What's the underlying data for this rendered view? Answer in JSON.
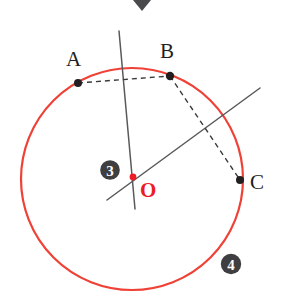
{
  "figure": {
    "width": 281,
    "height": 308,
    "background": "#ffffff"
  },
  "colors": {
    "circle_stroke": "#ef4136",
    "center_accent": "#ed1c24",
    "point_fill": "#231f20",
    "line_stroke": "#58595b",
    "dash_stroke": "#3a3a3a",
    "badge_fill": "#3f3f41",
    "badge_text": "#ffffff",
    "chevron_fill": "#4a4a4c"
  },
  "circle": {
    "name": "main-circle",
    "cx": 132,
    "cy": 179,
    "r": 111,
    "stroke_width": 2.2
  },
  "points": [
    {
      "id": "A",
      "label": "A",
      "x": 78,
      "y": 83,
      "label_x": 66,
      "label_y": 66,
      "dot_r": 4.0,
      "color": "#231f20"
    },
    {
      "id": "B",
      "label": "B",
      "x": 170,
      "y": 76,
      "label_x": 160,
      "label_y": 58,
      "dot_r": 4.2,
      "color": "#231f20"
    },
    {
      "id": "C",
      "label": "C",
      "x": 240,
      "y": 180,
      "label_x": 250,
      "label_y": 189,
      "dot_r": 4.0,
      "color": "#231f20"
    }
  ],
  "center": {
    "id": "O",
    "label": "O",
    "x": 133,
    "y": 177,
    "label_x": 140,
    "label_y": 197,
    "dot_r": 3.4,
    "color": "#ed1c24"
  },
  "chords": [
    {
      "name": "chord-AB",
      "from": "A",
      "to": "B",
      "x1": 78,
      "y1": 83,
      "x2": 170,
      "y2": 76,
      "style": "dashed"
    },
    {
      "name": "chord-BC",
      "from": "B",
      "to": "C",
      "x1": 170,
      "y1": 76,
      "x2": 240,
      "y2": 180,
      "style": "dashed"
    }
  ],
  "lines": [
    {
      "name": "perpendicular-bisector-line",
      "x1": 119,
      "y1": 31,
      "x2": 135,
      "y2": 209,
      "style": "solid"
    },
    {
      "name": "oblique-bisector-line",
      "x1": 107,
      "y1": 200,
      "x2": 260,
      "y2": 88,
      "style": "solid"
    }
  ],
  "badges": [
    {
      "name": "badge-3",
      "label": "3",
      "cx": 110,
      "cy": 170,
      "r": 9.8
    },
    {
      "name": "badge-4",
      "label": "4",
      "cx": 231,
      "cy": 264,
      "r": 10.2
    }
  ],
  "chevron": {
    "name": "chevron-down-icon",
    "cx": 142,
    "top_y": 0,
    "half_width": 9,
    "height": 11
  },
  "dash_pattern": "5,4"
}
